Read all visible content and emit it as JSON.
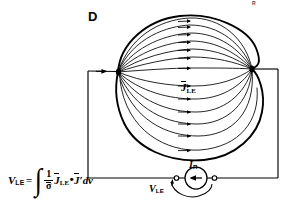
{
  "figure": {
    "panel_letter": "D",
    "corner_mark": "R",
    "background_color": "#ffffff",
    "ink_color": "#000000"
  },
  "labels": {
    "field_vector": {
      "base": "J",
      "subscript": "LE",
      "overbar": true
    },
    "current_source": {
      "base": "I",
      "subscript": "R"
    },
    "source_voltage": {
      "base": "V",
      "subscript": "LE"
    }
  },
  "equation": {
    "lhs": {
      "base": "V",
      "subscript": "LE"
    },
    "equals": "=",
    "integral": "∫",
    "fraction": {
      "numerator": "1",
      "denominator": "σ",
      "denominator_overbar": true
    },
    "term1": {
      "base": "J",
      "subscript": "LE",
      "overbar": true
    },
    "dot": "•",
    "term2": {
      "base": "J",
      "prime": "′",
      "overbar": true
    },
    "differential": "dv"
  },
  "diagram": {
    "blob": {
      "left_node": [
        118,
        72
      ],
      "right_node": [
        252,
        69
      ],
      "flow_line_count": 13,
      "arrow_count": 13
    },
    "circuit": {
      "left_wire_arrow": [
        100,
        71
      ],
      "corner_top_left": [
        88,
        71
      ],
      "corner_bottom_left": [
        88,
        178
      ],
      "corner_top_right": [
        278,
        69
      ],
      "corner_bottom_right": [
        278,
        178
      ],
      "source_center": [
        196,
        178
      ],
      "source_radius": 11,
      "terminal_left": [
        176,
        178
      ],
      "terminal_right": [
        215,
        178
      ]
    }
  }
}
